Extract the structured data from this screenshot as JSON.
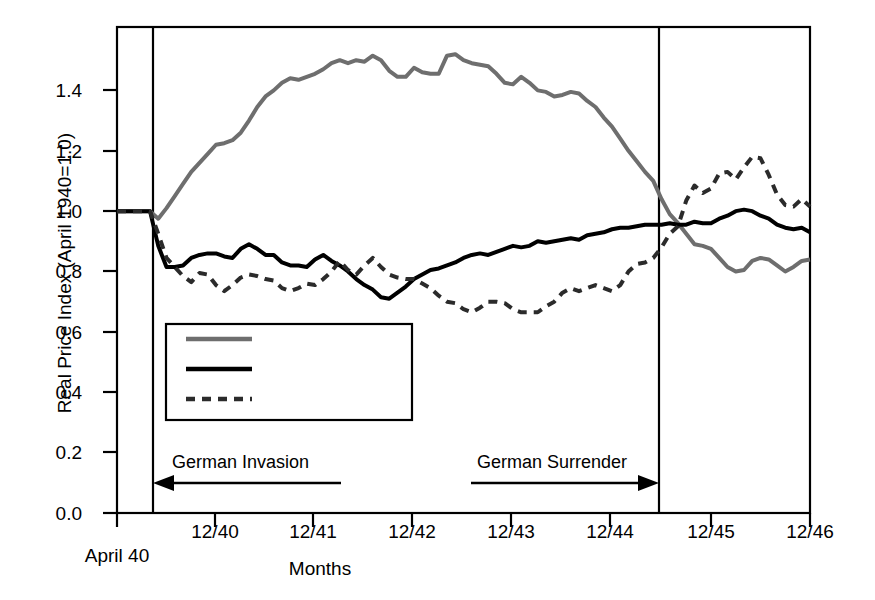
{
  "chart_data": {
    "type": "line",
    "title": "",
    "xlabel": "Months",
    "ylabel": "Real Price Index (April 1940=1.0)",
    "ylim": [
      0.0,
      1.61
    ],
    "xlim_months": [
      0,
      80
    ],
    "grid": false,
    "legend_position": "lower-left-inside",
    "y_ticks": [
      "0.0",
      "0.2",
      "0.4",
      "0.6",
      "0.8",
      "1.0",
      "1.2",
      "1.4"
    ],
    "y_tick_values": [
      0.0,
      0.2,
      0.4,
      0.6,
      0.8,
      1.0,
      1.2,
      1.4
    ],
    "x_ticks": [
      "April 40",
      "12/40",
      "12/41",
      "12/42",
      "12/43",
      "12/44",
      "12/45",
      "12/46"
    ],
    "x_tick_months": [
      -4,
      8,
      20,
      32,
      44,
      56,
      68,
      80
    ],
    "annotations": [
      {
        "label": "German Invasion",
        "arrow": "left",
        "from_month": 22,
        "to_month": 0
      },
      {
        "label": "German Surrender",
        "arrow": "right",
        "from_month": 38,
        "to_month": 61
      }
    ],
    "vertical_markers": [
      {
        "name": "german-invasion-line",
        "month": 0
      },
      {
        "name": "german-surrender-line",
        "month": 61
      }
    ],
    "series": [
      {
        "name": "Occupied (10)",
        "style": "solid",
        "color": "#6e6e6e",
        "width": 4,
        "x": [
          -4,
          0,
          1,
          2,
          3,
          4,
          5,
          6,
          7,
          8,
          9,
          10,
          11,
          12,
          13,
          14,
          15,
          16,
          17,
          18,
          19,
          20,
          21,
          22,
          23,
          24,
          25,
          26,
          27,
          28,
          29,
          30,
          31,
          32,
          33,
          34,
          35,
          36,
          37,
          38,
          39,
          40,
          41,
          42,
          43,
          44,
          45,
          46,
          47,
          48,
          49,
          50,
          51,
          52,
          53,
          54,
          55,
          56,
          57,
          58,
          59,
          60,
          61,
          62,
          63,
          64,
          65,
          66,
          67,
          68,
          69,
          70,
          71,
          72,
          73,
          74,
          75,
          76,
          77,
          78,
          79,
          80
        ],
        "values": [
          1.0,
          1.0,
          0.975,
          1.01,
          1.05,
          1.09,
          1.13,
          1.16,
          1.19,
          1.22,
          1.225,
          1.235,
          1.26,
          1.3,
          1.345,
          1.38,
          1.4,
          1.425,
          1.44,
          1.435,
          1.445,
          1.455,
          1.47,
          1.49,
          1.5,
          1.49,
          1.5,
          1.495,
          1.515,
          1.5,
          1.465,
          1.445,
          1.445,
          1.475,
          1.46,
          1.455,
          1.455,
          1.515,
          1.52,
          1.5,
          1.49,
          1.485,
          1.48,
          1.455,
          1.425,
          1.42,
          1.445,
          1.425,
          1.4,
          1.395,
          1.38,
          1.385,
          1.395,
          1.39,
          1.365,
          1.345,
          1.31,
          1.28,
          1.24,
          1.2,
          1.165,
          1.13,
          1.1,
          1.04,
          0.99,
          0.96,
          0.925,
          0.89,
          0.885,
          0.875,
          0.845,
          0.815,
          0.8,
          0.805,
          0.835,
          0.845,
          0.84,
          0.82,
          0.8,
          0.815,
          0.835,
          0.84
        ]
      },
      {
        "name": "Allied (6)",
        "style": "solid",
        "color": "#000000",
        "width": 4,
        "x": [
          -4,
          0,
          1,
          2,
          3,
          4,
          5,
          6,
          7,
          8,
          9,
          10,
          11,
          12,
          13,
          14,
          15,
          16,
          17,
          18,
          19,
          20,
          21,
          22,
          23,
          24,
          25,
          26,
          27,
          28,
          29,
          30,
          31,
          32,
          33,
          34,
          35,
          36,
          37,
          38,
          39,
          40,
          41,
          42,
          43,
          44,
          45,
          46,
          47,
          48,
          49,
          50,
          51,
          52,
          53,
          54,
          55,
          56,
          57,
          58,
          59,
          60,
          61,
          62,
          63,
          64,
          65,
          66,
          67,
          68,
          69,
          70,
          71,
          72,
          73,
          74,
          75,
          76,
          77,
          78,
          79,
          80
        ],
        "values": [
          1.0,
          1.0,
          0.885,
          0.815,
          0.815,
          0.82,
          0.845,
          0.855,
          0.86,
          0.86,
          0.85,
          0.845,
          0.875,
          0.89,
          0.875,
          0.855,
          0.855,
          0.83,
          0.82,
          0.82,
          0.815,
          0.84,
          0.855,
          0.835,
          0.82,
          0.8,
          0.775,
          0.755,
          0.74,
          0.715,
          0.71,
          0.73,
          0.75,
          0.775,
          0.79,
          0.805,
          0.81,
          0.82,
          0.83,
          0.845,
          0.855,
          0.86,
          0.855,
          0.865,
          0.875,
          0.885,
          0.88,
          0.885,
          0.9,
          0.895,
          0.9,
          0.905,
          0.91,
          0.905,
          0.92,
          0.925,
          0.93,
          0.94,
          0.945,
          0.945,
          0.95,
          0.955,
          0.955,
          0.955,
          0.96,
          0.955,
          0.955,
          0.965,
          0.96,
          0.96,
          0.975,
          0.985,
          1.0,
          1.005,
          1.0,
          0.985,
          0.975,
          0.955,
          0.945,
          0.94,
          0.945,
          0.93
        ]
      },
      {
        "name": "Neutral (2)",
        "style": "dashed",
        "color": "#2b2b2b",
        "width": 4,
        "x": [
          -4,
          0,
          1,
          2,
          3,
          4,
          5,
          6,
          7,
          8,
          9,
          10,
          11,
          12,
          13,
          14,
          15,
          16,
          17,
          18,
          19,
          20,
          21,
          22,
          23,
          24,
          25,
          26,
          27,
          28,
          29,
          30,
          31,
          32,
          33,
          34,
          35,
          36,
          37,
          38,
          39,
          40,
          41,
          42,
          43,
          44,
          45,
          46,
          47,
          48,
          49,
          50,
          51,
          52,
          53,
          54,
          55,
          56,
          57,
          58,
          59,
          60,
          61,
          62,
          63,
          64,
          65,
          66,
          67,
          68,
          69,
          70,
          71,
          72,
          73,
          74,
          75,
          76,
          77,
          78,
          79,
          80
        ],
        "values": [
          1.0,
          1.0,
          0.925,
          0.845,
          0.815,
          0.785,
          0.765,
          0.795,
          0.79,
          0.755,
          0.735,
          0.755,
          0.78,
          0.79,
          0.785,
          0.775,
          0.77,
          0.745,
          0.735,
          0.745,
          0.76,
          0.755,
          0.775,
          0.8,
          0.835,
          0.805,
          0.79,
          0.82,
          0.845,
          0.815,
          0.79,
          0.78,
          0.775,
          0.775,
          0.76,
          0.745,
          0.72,
          0.7,
          0.695,
          0.675,
          0.665,
          0.68,
          0.7,
          0.7,
          0.695,
          0.675,
          0.665,
          0.665,
          0.665,
          0.685,
          0.7,
          0.73,
          0.745,
          0.735,
          0.745,
          0.755,
          0.745,
          0.735,
          0.755,
          0.8,
          0.825,
          0.83,
          0.845,
          0.88,
          0.925,
          0.95,
          1.035,
          1.085,
          1.06,
          1.075,
          1.125,
          1.13,
          1.105,
          1.145,
          1.18,
          1.175,
          1.12,
          1.055,
          1.02,
          1.015,
          1.04,
          1.015
        ]
      }
    ]
  },
  "legend": {
    "entries": [
      {
        "label": "Occupied (10)",
        "style": "solid",
        "color": "#6e6e6e"
      },
      {
        "label": "Allied (6)",
        "style": "solid",
        "color": "#000000"
      },
      {
        "label": "Neutral (2)",
        "style": "dashed",
        "color": "#2b2b2b"
      }
    ]
  }
}
